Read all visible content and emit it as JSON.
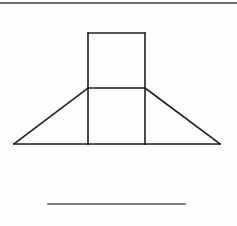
{
  "page": {
    "background_color": "#fefefe",
    "width": 237,
    "height": 226
  },
  "style": {
    "stroke_color": "#1f1f1f",
    "stroke_color_light": "#6e6e6e",
    "stroke_width_main": 1.6,
    "stroke_width_thin": 1.3,
    "fill": "none"
  },
  "figure": {
    "name": "house-like-figure",
    "elements": [
      {
        "name": "top-border-rule",
        "type": "line",
        "points": [
          [
            0,
            3
          ],
          [
            237,
            3
          ]
        ],
        "stroke": "#3a3a3a",
        "stroke_width": 1.4
      },
      {
        "name": "rectangle-left-edge",
        "type": "line",
        "points": [
          [
            88,
            33
          ],
          [
            88,
            144
          ]
        ],
        "stroke": "#1f1f1f",
        "stroke_width": 1.6
      },
      {
        "name": "rectangle-right-edge",
        "type": "line",
        "points": [
          [
            145,
            33
          ],
          [
            145,
            144
          ]
        ],
        "stroke": "#1f1f1f",
        "stroke_width": 1.6
      },
      {
        "name": "rectangle-top-edge",
        "type": "line",
        "points": [
          [
            88,
            33
          ],
          [
            145,
            33
          ]
        ],
        "stroke": "#1f1f1f",
        "stroke_width": 1.6
      },
      {
        "name": "rectangle-mid-divider",
        "type": "line",
        "points": [
          [
            88,
            88
          ],
          [
            145,
            88
          ]
        ],
        "stroke": "#1f1f1f",
        "stroke_width": 1.6
      },
      {
        "name": "triangle-left-slope",
        "type": "line",
        "points": [
          [
            14,
            144
          ],
          [
            88,
            88
          ]
        ],
        "stroke": "#1f1f1f",
        "stroke_width": 1.6
      },
      {
        "name": "triangle-right-slope",
        "type": "line",
        "points": [
          [
            145,
            88
          ],
          [
            220,
            144
          ]
        ],
        "stroke": "#1f1f1f",
        "stroke_width": 1.6
      },
      {
        "name": "baseline-left-segment",
        "type": "line",
        "points": [
          [
            14,
            144
          ],
          [
            88,
            144
          ]
        ],
        "stroke": "#1f1f1f",
        "stroke_width": 1.6
      },
      {
        "name": "baseline-middle-segment",
        "type": "line",
        "points": [
          [
            88,
            144
          ],
          [
            145,
            144
          ]
        ],
        "stroke": "#1f1f1f",
        "stroke_width": 1.6
      },
      {
        "name": "baseline-right-segment",
        "type": "line",
        "points": [
          [
            145,
            144
          ],
          [
            220,
            144
          ]
        ],
        "stroke": "#1f1f1f",
        "stroke_width": 1.6
      },
      {
        "name": "bottom-rule",
        "type": "line",
        "points": [
          [
            48,
            204
          ],
          [
            185,
            204
          ]
        ],
        "stroke": "#555555",
        "stroke_width": 1.5
      }
    ]
  }
}
